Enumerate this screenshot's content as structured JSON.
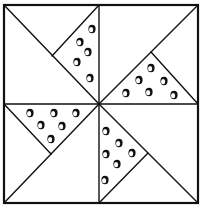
{
  "diagram": {
    "title": "",
    "type": "quilt-block-pinwheel",
    "colors": {
      "line": "#111111",
      "background": "#ffffff"
    },
    "frame": {
      "x1": 4,
      "y1": 5,
      "x2": 198,
      "y2": 203
    },
    "center": {
      "x": 99,
      "y": 104
    },
    "quadrants": [
      {
        "name": "top-left",
        "diagonal": [
          4,
          5,
          99,
          104
        ],
        "splitter": [
          99,
          5,
          52,
          56
        ],
        "dots": [
          [
            92,
            29
          ],
          [
            80,
            42
          ],
          [
            88,
            52
          ],
          [
            77,
            62
          ],
          [
            90,
            78
          ]
        ]
      },
      {
        "name": "top-right",
        "diagonal": [
          99,
          104,
          198,
          5
        ],
        "splitter": [
          151,
          52,
          198,
          104
        ],
        "dots": [
          [
            151,
            68
          ],
          [
            139,
            80
          ],
          [
            164,
            81
          ],
          [
            126,
            93
          ],
          [
            149,
            92
          ],
          [
            174,
            95
          ]
        ]
      },
      {
        "name": "bottom-left",
        "diagonal": [
          4,
          203,
          99,
          104
        ],
        "splitter": [
          4,
          104,
          51,
          154
        ],
        "dots": [
          [
            30,
            113
          ],
          [
            54,
            113
          ],
          [
            76,
            113
          ],
          [
            41,
            125
          ],
          [
            62,
            126
          ],
          [
            51,
            139
          ]
        ]
      },
      {
        "name": "bottom-right",
        "diagonal": [
          99,
          104,
          198,
          203
        ],
        "splitter": [
          148,
          153,
          99,
          203
        ],
        "dots": [
          [
            106,
            131
          ],
          [
            119,
            143
          ],
          [
            106,
            154
          ],
          [
            132,
            153
          ],
          [
            117,
            164
          ],
          [
            105,
            180
          ]
        ]
      }
    ]
  }
}
